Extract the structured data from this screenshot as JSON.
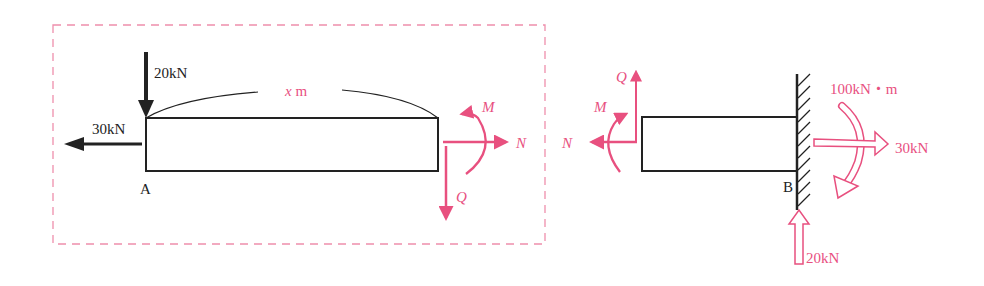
{
  "colors": {
    "ink": "#222222",
    "accent": "#e8507f",
    "dash": "#ee8fac"
  },
  "left_free_body": {
    "point_label": "A",
    "vertical_load": "20kN",
    "horizontal_load": "30kN",
    "length_label_var": "x",
    "length_label_unit": " m",
    "cut_forces": {
      "moment": "M",
      "normal": "N",
      "shear": "Q"
    }
  },
  "right_free_body": {
    "cut_forces": {
      "moment": "M",
      "normal": "N",
      "shear": "Q"
    },
    "support_label": "B",
    "reactions": {
      "moment": "100kN・m",
      "horizontal": "30kN",
      "vertical": "20kN"
    }
  }
}
